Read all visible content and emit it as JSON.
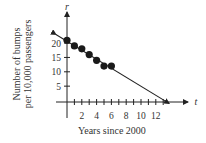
{
  "chart_data": {
    "type": "scatter",
    "title": "",
    "xlabel": "Years since 2000",
    "ylabel": "Number of bumps per 10,000 passengers",
    "ylabel_lines": [
      "Number of bumps",
      "per 10,000 passengers"
    ],
    "x_axis_var": "t",
    "y_axis_var": "r",
    "x_ticks": [
      2,
      4,
      6,
      8,
      10,
      12
    ],
    "y_ticks": [
      5,
      10,
      15,
      20
    ],
    "xlim": [
      -1.5,
      14
    ],
    "ylim": [
      -1,
      24
    ],
    "grid": false,
    "legend": null,
    "points": [
      {
        "x": 0,
        "y": 21
      },
      {
        "x": 1,
        "y": 19
      },
      {
        "x": 2,
        "y": 18
      },
      {
        "x": 3,
        "y": 16
      },
      {
        "x": 4,
        "y": 14
      },
      {
        "x": 5,
        "y": 12
      },
      {
        "x": 6,
        "y": 12
      }
    ],
    "trend_line": {
      "type": "linear",
      "x_start": -1.5,
      "y_start": 23,
      "x_end": 13.8,
      "y_end": -1,
      "x_intercept": 13.2,
      "y_intercept": 21
    }
  }
}
